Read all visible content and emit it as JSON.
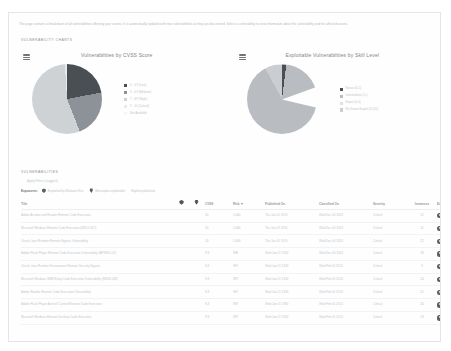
{
  "page": {
    "intro": "This page contains a breakdown of all vulnerabilities affecting your assets. It is automatically updated with new vulnerabilities as they are discovered. Select a vulnerability to view information about the vulnerability and the affected assets."
  },
  "charts_section": {
    "heading": "VULNERABILITY CHARTS",
    "menu_icon": "hamburger-menu-icon"
  },
  "chart_data": [
    {
      "type": "pie",
      "title": "Vulnerabilities by CVSS Score",
      "legend_position": "right",
      "categories": [
        "0 - 3.9 (Low)",
        "4 - 6.9 (Medium)",
        "7 - 8.9 (High)",
        "9 - 10 (Critical)",
        "Not Available"
      ],
      "values": [
        22,
        22,
        55,
        1,
        0
      ],
      "colors": [
        "#4a4f54",
        "#8d9298",
        "#cfd2d5",
        "#e8eaec",
        "#f5f6f7"
      ]
    },
    {
      "type": "pie",
      "title": "Exploitable Vulnerabilities by Skill Level",
      "legend_position": "right",
      "categories": [
        "Novice (0-1)",
        "Intermediate (1+)",
        "Expert (0-0)",
        "No Known Exploit (4,131)"
      ],
      "values": [
        2,
        90,
        0,
        8
      ],
      "colors": [
        "#4a4f54",
        "#b9bdc1",
        "#dfe1e3",
        "#cbced1"
      ]
    }
  ],
  "vulnerabilities_section": {
    "heading": "VULNERABILITIES",
    "apply_filters": "Apply Filters (suggest)",
    "exposures_label": "Exposures:",
    "filters": [
      {
        "icon": "malware-kit-icon",
        "label": "Exploited by Malware Kits"
      },
      {
        "icon": "metasploit-icon",
        "label": "Metasploit-exploitable"
      },
      {
        "icon": "",
        "label": "Exploit published"
      }
    ],
    "table": {
      "columns": [
        {
          "key": "title",
          "label": "Title"
        },
        {
          "key": "malware",
          "label": "",
          "icon": "malware-kit-icon"
        },
        {
          "key": "exploit",
          "label": "",
          "icon": "metasploit-icon"
        },
        {
          "key": "cvss",
          "label": "CVSS"
        },
        {
          "key": "risk",
          "label": "Risk",
          "sorted": true
        },
        {
          "key": "published",
          "label": "Published On"
        },
        {
          "key": "modified",
          "label": "Classified On"
        },
        {
          "key": "severity",
          "label": "Severity"
        },
        {
          "key": "instances",
          "label": "Instances"
        },
        {
          "key": "exposures",
          "label": "Exposures"
        }
      ],
      "rows": [
        {
          "title": "Adobe Acrobat and Reader Remote Code Execution",
          "cvss": "10",
          "risk": "1,000",
          "published": "Thu Jan 01 1970",
          "modified": "Wed Dec 04 2013",
          "severity": "Critical",
          "instances": "12",
          "exposures": "Malware"
        },
        {
          "title": "Microsoft Windows Remote Code Execution (MS12-027)",
          "cvss": "10",
          "risk": "1,000",
          "published": "Thu Jan 01 1970",
          "modified": "Wed Dec 04 2013",
          "severity": "Critical",
          "instances": "11",
          "exposures": "Malware"
        },
        {
          "title": "Oracle Java Runtime Remote Bypass Vulnerability",
          "cvss": "10",
          "risk": "1,000",
          "published": "Thu Jan 01 1970",
          "modified": "Wed Dec 04 2013",
          "severity": "Critical",
          "instances": "22",
          "exposures": "Malware"
        },
        {
          "title": "Adobe Flash Player Remote Code Execution Vulnerability (APSB11-02)",
          "cvss": "9.3",
          "risk": "998",
          "published": "Wed Jan 01 1992",
          "modified": "Wed Dec 04 2013",
          "severity": "Critical",
          "instances": "18",
          "exposures": "Malware"
        },
        {
          "title": "Oracle Java Runtime Environment Remote Security Bypass",
          "cvss": "9.3",
          "risk": "997",
          "published": "Wed Jan 01 1992",
          "modified": "Wed Feb 05 2014",
          "severity": "Critical",
          "instances": "9",
          "exposures": "Malware"
        },
        {
          "title": "Microsoft Windows SMB Relay Code Execution Vulnerability (MS08-068)",
          "cvss": "9.3",
          "risk": "997",
          "published": "Wed Jan 01 1992",
          "modified": "Wed Feb 05 2014",
          "severity": "Critical",
          "instances": "14",
          "exposures": "Malware"
        },
        {
          "title": "Adobe Reader Remote Code Execution Vulnerability",
          "cvss": "9.3",
          "risk": "997",
          "published": "Wed Jan 01 1992",
          "modified": "Wed Feb 05 2014",
          "severity": "Critical",
          "instances": "21",
          "exposures": "Malware"
        },
        {
          "title": "Adobe Flash Player ActiveX Control Remote Code Execution",
          "cvss": "9.3",
          "risk": "997",
          "published": "Wed Jan 01 1992",
          "modified": "Wed Feb 05 2014",
          "severity": "Critical",
          "instances": "16",
          "exposures": "Malware"
        },
        {
          "title": "Microsoft Windows Remote Desktop Code Execution",
          "cvss": "9.3",
          "risk": "997",
          "published": "Wed Jan 01 1992",
          "modified": "Wed Feb 05 2014",
          "severity": "Critical",
          "instances": "13",
          "exposures": "Malware"
        }
      ]
    }
  }
}
